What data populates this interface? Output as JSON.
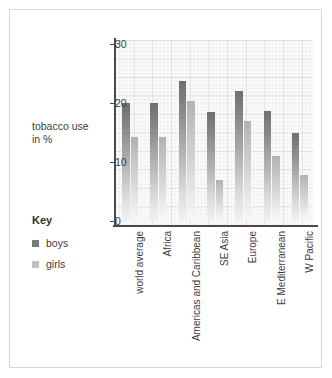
{
  "axis_title": {
    "line1": "tobacco use",
    "line2": "in %"
  },
  "legend": {
    "title": "Key",
    "items": [
      {
        "label": "boys",
        "color": "#7a7a7a"
      },
      {
        "label": "girls",
        "color": "#c0c0c0"
      }
    ]
  },
  "chart_data": {
    "type": "bar",
    "title": "",
    "xlabel": "",
    "ylabel": "tobacco use in %",
    "ylim": [
      0,
      30
    ],
    "yticks": [
      0,
      10,
      20,
      30
    ],
    "ytick_labels": [
      "0",
      "10",
      "20",
      "30"
    ],
    "grid": true,
    "legend_position": "left",
    "categories": [
      "world average",
      "Africa",
      "Americas and Caribbean",
      "SE Asia",
      "Europe",
      "E Mediterranean",
      "W Pacific"
    ],
    "series": [
      {
        "name": "boys",
        "color": "#7a7a7a",
        "values": [
          20.0,
          20.0,
          23.7,
          18.4,
          22.1,
          18.7,
          14.9
        ]
      },
      {
        "name": "girls",
        "color": "#c0c0c0",
        "values": [
          14.2,
          14.2,
          20.3,
          7.0,
          16.9,
          11.1,
          7.8
        ]
      }
    ]
  }
}
